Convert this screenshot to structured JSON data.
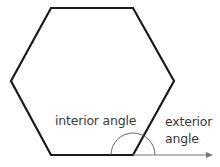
{
  "diagram": {
    "shape": "regular hexagon",
    "labels": {
      "interior": "interior angle",
      "exterior_line1": "exterior",
      "exterior_line2": "angle"
    },
    "colors": {
      "outline": "#1a1a1a",
      "arc": "#555555",
      "arrow": "#777777",
      "text": "#3a3a3a"
    }
  }
}
